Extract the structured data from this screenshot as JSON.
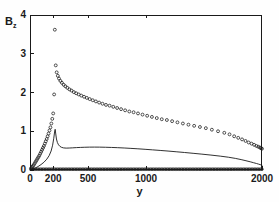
{
  "chart_data": {
    "type": "scatter",
    "title": "",
    "xlabel": "y",
    "ylabel": "B_z",
    "ylabel_base": "B",
    "ylabel_sub": "z",
    "xlim": [
      0,
      2000
    ],
    "ylim": [
      0,
      4
    ],
    "grid": false,
    "legend": "none",
    "background": "#ffffff",
    "ink_color": "#1a1a1a",
    "xticks": [
      {
        "value": 0,
        "label": "0"
      },
      {
        "value": 200,
        "label": "200"
      },
      {
        "value": 500,
        "label": "500"
      },
      {
        "value": 1000,
        "label": "1000"
      },
      {
        "value": 2000,
        "label": "2000"
      }
    ],
    "yticks": [
      {
        "value": 0,
        "label": "0"
      },
      {
        "value": 1,
        "label": "1"
      },
      {
        "value": 2,
        "label": "2"
      },
      {
        "value": 3,
        "label": "3"
      },
      {
        "value": 4,
        "label": "4"
      }
    ],
    "series": [
      {
        "name": "open-circles",
        "marker": "circle-open",
        "style": "markers",
        "color": "#1a1a1a",
        "points": [
          [
            8,
            0.04
          ],
          [
            16,
            0.07
          ],
          [
            24,
            0.1
          ],
          [
            32,
            0.13
          ],
          [
            40,
            0.17
          ],
          [
            48,
            0.21
          ],
          [
            56,
            0.25
          ],
          [
            64,
            0.29
          ],
          [
            72,
            0.33
          ],
          [
            80,
            0.37
          ],
          [
            88,
            0.42
          ],
          [
            96,
            0.47
          ],
          [
            104,
            0.52
          ],
          [
            112,
            0.57
          ],
          [
            120,
            0.62
          ],
          [
            128,
            0.68
          ],
          [
            136,
            0.74
          ],
          [
            144,
            0.8
          ],
          [
            152,
            0.87
          ],
          [
            160,
            0.94
          ],
          [
            168,
            1.02
          ],
          [
            176,
            1.1
          ],
          [
            184,
            1.2
          ],
          [
            192,
            1.32
          ],
          [
            200,
            1.46
          ],
          [
            208,
            1.95
          ],
          [
            214,
            3.62
          ],
          [
            222,
            2.7
          ],
          [
            230,
            2.52
          ],
          [
            240,
            2.43
          ],
          [
            250,
            2.36
          ],
          [
            262,
            2.3
          ],
          [
            275,
            2.25
          ],
          [
            290,
            2.2
          ],
          [
            305,
            2.16
          ],
          [
            322,
            2.12
          ],
          [
            340,
            2.08
          ],
          [
            358,
            2.05
          ],
          [
            378,
            2.01
          ],
          [
            398,
            1.98
          ],
          [
            420,
            1.95
          ],
          [
            442,
            1.92
          ],
          [
            466,
            1.89
          ],
          [
            490,
            1.86
          ],
          [
            515,
            1.83
          ],
          [
            541,
            1.8
          ],
          [
            568,
            1.77
          ],
          [
            596,
            1.74
          ],
          [
            625,
            1.71
          ],
          [
            655,
            1.68
          ],
          [
            686,
            1.66
          ],
          [
            718,
            1.63
          ],
          [
            751,
            1.6
          ],
          [
            785,
            1.57
          ],
          [
            820,
            1.54
          ],
          [
            856,
            1.51
          ],
          [
            893,
            1.49
          ],
          [
            931,
            1.46
          ],
          [
            970,
            1.43
          ],
          [
            1010,
            1.4
          ],
          [
            1051,
            1.37
          ],
          [
            1093,
            1.34
          ],
          [
            1136,
            1.31
          ],
          [
            1180,
            1.29
          ],
          [
            1225,
            1.26
          ],
          [
            1271,
            1.23
          ],
          [
            1318,
            1.2
          ],
          [
            1366,
            1.17
          ],
          [
            1415,
            1.14
          ],
          [
            1465,
            1.11
          ],
          [
            1516,
            1.08
          ],
          [
            1568,
            1.04
          ],
          [
            1621,
            1.0
          ],
          [
            1675,
            0.96
          ],
          [
            1720,
            0.92
          ],
          [
            1760,
            0.87
          ],
          [
            1795,
            0.83
          ],
          [
            1828,
            0.79
          ],
          [
            1858,
            0.75
          ],
          [
            1885,
            0.71
          ],
          [
            1910,
            0.68
          ],
          [
            1932,
            0.65
          ],
          [
            1952,
            0.62
          ],
          [
            1968,
            0.6
          ],
          [
            1982,
            0.58
          ],
          [
            1992,
            0.56
          ],
          [
            2000,
            0.55
          ]
        ]
      },
      {
        "name": "solid-line-lower",
        "marker": "none",
        "style": "line",
        "color": "#1a1a1a",
        "points": [
          [
            0,
            0.0
          ],
          [
            20,
            0.02
          ],
          [
            45,
            0.05
          ],
          [
            70,
            0.09
          ],
          [
            95,
            0.14
          ],
          [
            120,
            0.2
          ],
          [
            145,
            0.28
          ],
          [
            165,
            0.37
          ],
          [
            182,
            0.49
          ],
          [
            195,
            0.64
          ],
          [
            205,
            0.82
          ],
          [
            212,
            0.98
          ],
          [
            217,
            1.05
          ],
          [
            222,
            0.93
          ],
          [
            228,
            0.8
          ],
          [
            236,
            0.71
          ],
          [
            246,
            0.65
          ],
          [
            258,
            0.61
          ],
          [
            272,
            0.585
          ],
          [
            290,
            0.57
          ],
          [
            312,
            0.565
          ],
          [
            338,
            0.567
          ],
          [
            368,
            0.572
          ],
          [
            400,
            0.578
          ],
          [
            435,
            0.583
          ],
          [
            472,
            0.587
          ],
          [
            512,
            0.59
          ],
          [
            555,
            0.591
          ],
          [
            600,
            0.59
          ],
          [
            650,
            0.587
          ],
          [
            702,
            0.582
          ],
          [
            756,
            0.576
          ],
          [
            812,
            0.568
          ],
          [
            870,
            0.558
          ],
          [
            930,
            0.547
          ],
          [
            992,
            0.534
          ],
          [
            1056,
            0.52
          ],
          [
            1122,
            0.505
          ],
          [
            1190,
            0.489
          ],
          [
            1260,
            0.471
          ],
          [
            1332,
            0.452
          ],
          [
            1406,
            0.431
          ],
          [
            1482,
            0.409
          ],
          [
            1560,
            0.385
          ],
          [
            1640,
            0.358
          ],
          [
            1710,
            0.33
          ],
          [
            1770,
            0.3
          ],
          [
            1820,
            0.269
          ],
          [
            1862,
            0.239
          ],
          [
            1898,
            0.212
          ],
          [
            1928,
            0.188
          ],
          [
            1952,
            0.168
          ],
          [
            1970,
            0.152
          ],
          [
            1984,
            0.139
          ],
          [
            1994,
            0.129
          ],
          [
            2000,
            0.123
          ]
        ]
      },
      {
        "name": "baseline-markers",
        "marker": "dot-dense",
        "style": "markers",
        "color": "#1a1a1a",
        "description": "dense row of markers along B_z = 0",
        "y_value": 0.02,
        "x_start": 10,
        "x_end": 2000,
        "count": 150
      }
    ]
  }
}
